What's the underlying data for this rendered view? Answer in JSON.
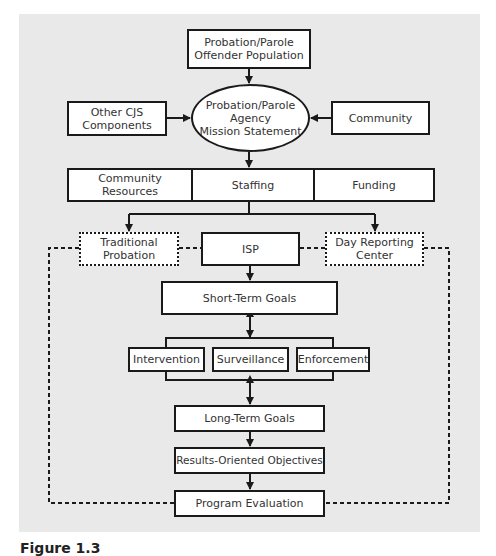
{
  "diagram": {
    "type": "flowchart",
    "nodes": {
      "offender_population": "Probation/Parole\nOffender Population",
      "mission_statement": "Probation/Parole\nAgency\nMission Statement",
      "other_cjs": "Other CJS\nComponents",
      "community": "Community",
      "resources": [
        "Community\nResources",
        "Staffing",
        "Funding"
      ],
      "traditional_probation": "Traditional\nProbation",
      "isp": "ISP",
      "day_reporting": "Day Reporting\nCenter",
      "short_term_goals": "Short-Term Goals",
      "strategies": [
        "Intervention",
        "Surveillance",
        "Enforcement"
      ],
      "long_term_goals": "Long-Term Goals",
      "results_objectives": "Results-Oriented Objectives",
      "program_evaluation": "Program Evaluation"
    },
    "edges": [
      {
        "from": "offender_population",
        "to": "mission_statement",
        "style": "solid-arrow"
      },
      {
        "from": "other_cjs",
        "to": "mission_statement",
        "style": "solid-arrow"
      },
      {
        "from": "community",
        "to": "mission_statement",
        "style": "solid-arrow"
      },
      {
        "from": "mission_statement",
        "to": "resources",
        "style": "solid-arrow"
      },
      {
        "from": "resources",
        "to": "traditional_probation",
        "style": "solid-arrow"
      },
      {
        "from": "resources",
        "to": "day_reporting",
        "style": "solid-arrow"
      },
      {
        "from": "traditional_probation",
        "to": "isp",
        "style": "dotted"
      },
      {
        "from": "day_reporting",
        "to": "isp",
        "style": "dotted"
      },
      {
        "from": "isp",
        "to": "short_term_goals",
        "style": "solid-arrow"
      },
      {
        "from": "short_term_goals",
        "to": "strategies",
        "style": "bidirectional"
      },
      {
        "from": "strategies",
        "to": "long_term_goals",
        "style": "bidirectional"
      },
      {
        "from": "long_term_goals",
        "to": "results_objectives",
        "style": "solid-arrow"
      },
      {
        "from": "results_objectives",
        "to": "program_evaluation",
        "style": "solid-arrow"
      },
      {
        "from": "program_evaluation",
        "to": "traditional_probation",
        "style": "dotted-loop"
      },
      {
        "from": "program_evaluation",
        "to": "day_reporting",
        "style": "dotted-loop"
      }
    ]
  },
  "caption": "Figure 1.3"
}
